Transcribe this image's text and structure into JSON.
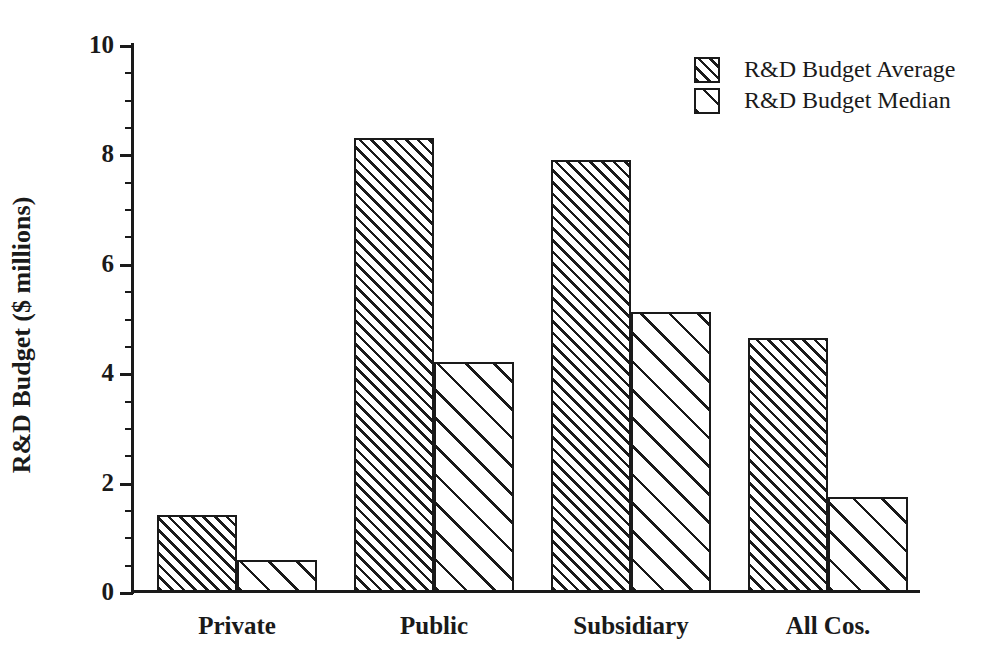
{
  "chart_data": {
    "type": "bar",
    "title": "",
    "subtitle": "",
    "xlabel": "",
    "ylabel": "R&D Budget ($ millions)",
    "categories": [
      "Private",
      "Public",
      "Subsidiary",
      "All Cos."
    ],
    "series": [
      {
        "name": "R&D Budget Average",
        "values": [
          1.4,
          8.3,
          7.9,
          4.65
        ],
        "fill": "dense-diagonal-hatch"
      },
      {
        "name": "R&D Budget Median",
        "values": [
          0.58,
          4.2,
          5.12,
          1.73
        ],
        "fill": "sparse-diagonal-hatch"
      }
    ],
    "ylim": [
      0,
      10
    ],
    "y_major_ticks": [
      0,
      2,
      4,
      6,
      8,
      10
    ],
    "y_major_tick_labels": [
      "0",
      "2",
      "4",
      "6",
      "8",
      "10"
    ],
    "y_minor_ticks": [
      0.5,
      1,
      1.5,
      2.5,
      3,
      3.5,
      4.5,
      5,
      5.5,
      6.5,
      7,
      7.5,
      8.5,
      9,
      9.5
    ],
    "grid": false,
    "legend_position": "top-right",
    "legend_frame": false,
    "colors": {
      "ink": "#1a1a1a",
      "background": "#ffffff"
    }
  },
  "legend": {
    "items": [
      {
        "label": "R&D Budget Average"
      },
      {
        "label": "R&D Budget Median"
      }
    ]
  }
}
